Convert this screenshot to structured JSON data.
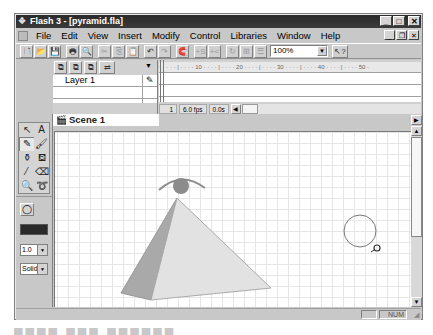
{
  "window": {
    "title": "Flash 3 - [pyramid.fla]",
    "controls": [
      "minimize",
      "maximize",
      "close"
    ],
    "mdi_controls": [
      "minimize",
      "restore",
      "close"
    ]
  },
  "menubar": {
    "items": [
      {
        "label": "File",
        "accel": "F"
      },
      {
        "label": "Edit",
        "accel": "E"
      },
      {
        "label": "View",
        "accel": "V"
      },
      {
        "label": "Insert",
        "accel": "I"
      },
      {
        "label": "Modify",
        "accel": "o"
      },
      {
        "label": "Control",
        "accel": "C"
      },
      {
        "label": "Libraries",
        "accel": "L"
      },
      {
        "label": "Window",
        "accel": "W"
      },
      {
        "label": "Help",
        "accel": "H"
      }
    ]
  },
  "toolbar": {
    "buttons": [
      {
        "icon": "new-icon",
        "glyph": "🗋"
      },
      {
        "icon": "open-icon",
        "glyph": "📂"
      },
      {
        "icon": "save-icon",
        "glyph": "💾"
      },
      {
        "icon": "print-icon",
        "glyph": "🖶"
      },
      {
        "icon": "print-preview-icon",
        "glyph": "🔍"
      },
      {
        "icon": "cut-icon",
        "glyph": "✂",
        "disabled": true
      },
      {
        "icon": "copy-icon",
        "glyph": "⎘",
        "disabled": true
      },
      {
        "icon": "paste-icon",
        "glyph": "📋"
      },
      {
        "icon": "undo-icon",
        "glyph": "↶"
      },
      {
        "icon": "redo-icon",
        "glyph": "↷",
        "disabled": true
      },
      {
        "icon": "snap-icon",
        "glyph": "🧲"
      },
      {
        "icon": "smooth-icon",
        "glyph": "+S",
        "disabled": true
      },
      {
        "icon": "straighten-icon",
        "glyph": "+<",
        "disabled": true
      },
      {
        "icon": "rotate-icon",
        "glyph": "↻",
        "disabled": true
      },
      {
        "icon": "scale-icon",
        "glyph": "⊞",
        "disabled": true
      },
      {
        "icon": "align-icon",
        "glyph": "☰",
        "disabled": true
      }
    ],
    "zoom_value": "100%",
    "help_glyph": "↖?"
  },
  "timeline": {
    "layer_buttons": [
      "add-layer",
      "remove-layer",
      "layer-properties",
      "onion-skin"
    ],
    "layers": [
      {
        "name": "Layer 1",
        "edit_icon": "✎"
      }
    ],
    "ruler": "ᐧ · · · · | · · · · 10 · · · · | · · · · 20 · · · · | · · · · 30 · · · · | · · · · 40 · · · · | · · · · 50 ·",
    "status": {
      "frame": "1",
      "fps": "6.0 fps",
      "time": "0.0s"
    }
  },
  "scene": {
    "name": "Scene 1"
  },
  "toolbox": {
    "tools": [
      {
        "name": "arrow",
        "glyph": "↖"
      },
      {
        "name": "text",
        "glyph": "A"
      },
      {
        "name": "pencil",
        "glyph": "✎",
        "pressed": true
      },
      {
        "name": "brush",
        "glyph": "🖌"
      },
      {
        "name": "ink-bottle",
        "glyph": "⚱"
      },
      {
        "name": "paint-bucket",
        "glyph": "⛾"
      },
      {
        "name": "dropper",
        "glyph": "⁄"
      },
      {
        "name": "eraser",
        "glyph": "⌫"
      },
      {
        "name": "magnifier",
        "glyph": "🔍"
      },
      {
        "name": "lasso",
        "glyph": "➰"
      }
    ],
    "option_glyph": "◯",
    "stroke_color": "#2a2a2a",
    "line_width": "1.0",
    "line_style": "Solid"
  },
  "statusbar": {
    "num": "NUM"
  }
}
